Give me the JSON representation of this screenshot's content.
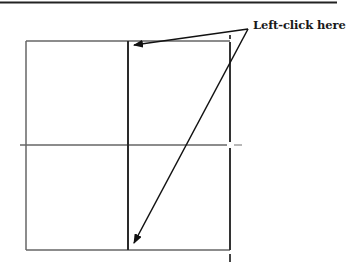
{
  "diagram": {
    "annotation": {
      "label": "Left-click here",
      "targets": [
        "top-of-middle-vertical-line",
        "bottom-of-middle-vertical-line"
      ]
    },
    "colors": {
      "line": "#555555",
      "dark_line": "#2a2a2a",
      "rule": "#222222",
      "arrow": "#111111"
    }
  }
}
